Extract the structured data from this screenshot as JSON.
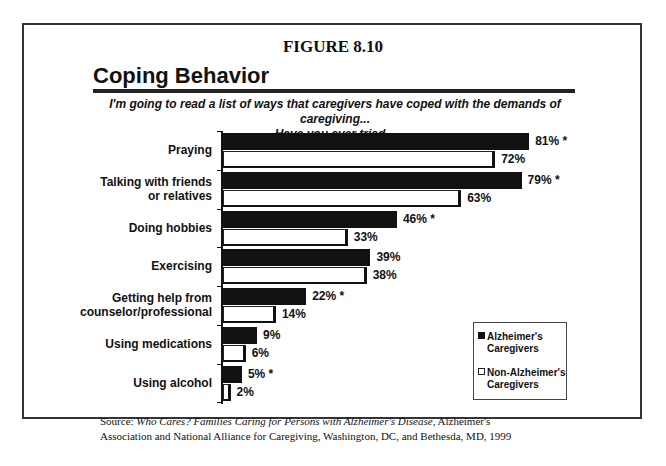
{
  "figure_label": "FIGURE 8.10",
  "title": "Coping Behavior",
  "subtitle_line1": "I'm going to read a list of ways that caregivers have coped with the demands of caregiving...",
  "subtitle_line2": "Have you ever tried...",
  "legend": {
    "alz_line1": "Alzheimer's",
    "alz_line2": "Caregivers",
    "non_line1": "Non-Alzheimer's",
    "non_line2": "Caregivers"
  },
  "source": {
    "prefix": "Source: ",
    "title": "Who Cares? Families Caring for Persons with Alzheimer's Disease",
    "rest1": ", Alzheimer's",
    "line2": "Association and National Alliance for Caregiving, Washington, DC, and Bethesda, MD, 1999"
  },
  "colors": {
    "alzheimers": "#111111",
    "non_alzheimers": "#ffffff"
  },
  "chart_data": {
    "type": "bar",
    "orientation": "horizontal",
    "title": "Coping Behavior",
    "subtitle": "I'm going to read a list of ways that caregivers have coped with the demands of caregiving... Have you ever tried...",
    "categories": [
      "Praying",
      "Talking with friends or relatives",
      "Doing hobbies",
      "Exercising",
      "Getting help from counselor/professional",
      "Using medications",
      "Using alcohol"
    ],
    "series": [
      {
        "name": "Alzheimer's Caregivers",
        "values": [
          81,
          79,
          46,
          39,
          22,
          9,
          5
        ],
        "labels": [
          "81% *",
          "79% *",
          "46% *",
          "39%",
          "22% *",
          "9%",
          "5% *"
        ]
      },
      {
        "name": "Non-Alzheimer's Caregivers",
        "values": [
          72,
          63,
          33,
          38,
          14,
          6,
          2
        ],
        "labels": [
          "72%",
          "63%",
          "33%",
          "38%",
          "14%",
          "6%",
          "2%"
        ]
      }
    ],
    "xlabel": "",
    "ylabel": "",
    "xlim": [
      0,
      100
    ],
    "unit": "%",
    "legend_position": "lower right",
    "grid": false,
    "annotation": "* indicates statistically significant difference"
  }
}
